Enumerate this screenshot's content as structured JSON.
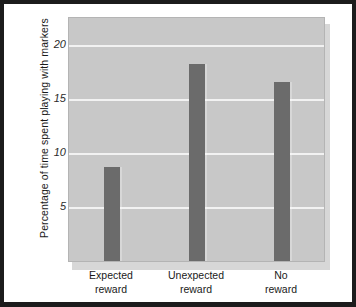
{
  "chart_data": {
    "type": "bar",
    "title": "",
    "subtitle": "",
    "xlabel": "",
    "ylabel": "Percentage of time spent playing with markers",
    "categories": [
      "Expected reward",
      "Unexpected reward",
      "No reward"
    ],
    "category_lines": [
      {
        "line1": "Expected",
        "line2": "reward"
      },
      {
        "line1": "Unexpected",
        "line2": "reward"
      },
      {
        "line1": "No",
        "line2": "reward"
      }
    ],
    "values": [
      8.7,
      18.2,
      16.6
    ],
    "ylim": [
      0,
      22.5
    ],
    "yticks": [
      5,
      10,
      15,
      20
    ],
    "ytick_labels": [
      "5",
      "10",
      "15",
      "20"
    ],
    "grid": "horizontal",
    "legend": "none",
    "bar_color": "#6b6b6b",
    "plot_background": "#c8c8c8",
    "gridline_color": "#f2f2f2",
    "page_background": "#ffffff",
    "frame_color": "#1c1c1c"
  }
}
